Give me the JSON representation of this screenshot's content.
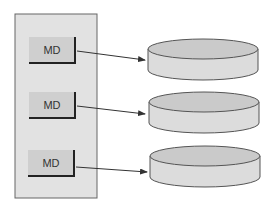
{
  "diagram": {
    "nodes": [
      {
        "label": "MD"
      },
      {
        "label": "MD"
      },
      {
        "label": "MD"
      }
    ],
    "disks": 3,
    "colors": {
      "panel_fill": "#e2e2e2",
      "panel_stroke": "#666666",
      "box_fill": "#cfcfcf",
      "box_shadow": "#222222",
      "disk_top": "#cacaca",
      "disk_side": "#dcdcdc",
      "arrow": "#333333"
    }
  }
}
